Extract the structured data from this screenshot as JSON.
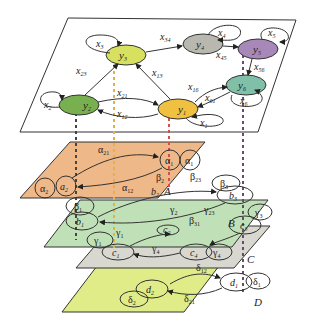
{
  "diagram": {
    "top_layer": {
      "nodes": [
        {
          "id": "y1",
          "label": "y",
          "sub": "1",
          "color": "#f0c040",
          "self_loop": "x1"
        },
        {
          "id": "y2",
          "label": "y",
          "sub": "2",
          "color": "#78b050",
          "self_loop": "x2"
        },
        {
          "id": "y3",
          "label": "y",
          "sub": "3",
          "color": "#d8e060",
          "self_loop": "x3"
        },
        {
          "id": "y4",
          "label": "y",
          "sub": "4",
          "color": "#b8b8b0",
          "self_loop": "x4"
        },
        {
          "id": "y5",
          "label": "y",
          "sub": "5",
          "color": "#a888b8",
          "self_loop": "x5"
        },
        {
          "id": "y6",
          "label": "y",
          "sub": "6",
          "color": "#80c0a8",
          "self_loop": "x6"
        }
      ],
      "edges": [
        {
          "from": "y3",
          "to": "y4",
          "label": "x34"
        },
        {
          "from": "y4",
          "to": "y5",
          "label": "x45"
        },
        {
          "from": "y5",
          "to": "y6",
          "label": "x56"
        },
        {
          "from": "y2",
          "to": "y3",
          "label": "x23"
        },
        {
          "from": "y1",
          "to": "y3",
          "label": "x13"
        },
        {
          "from": "y2",
          "to": "y1",
          "label": "x21"
        },
        {
          "from": "y1",
          "to": "y2",
          "label": "x12"
        },
        {
          "from": "y1",
          "to": "y6",
          "label": "x16"
        },
        {
          "from": "y6",
          "to": "y1",
          "label": "x61"
        }
      ]
    },
    "layer_A": {
      "name": "A",
      "color": "#eeb888",
      "nodes": [
        "a1",
        "a2"
      ],
      "labels": {
        "a21": "α21",
        "a12": "α12",
        "a1": "α1",
        "a2": "α2",
        "b2": "β2",
        "b23": "β23",
        "b12": "β12"
      }
    },
    "layer_B": {
      "name": "B",
      "color": "#c0e0b8",
      "nodes": [
        "b1",
        "b2",
        "b3"
      ],
      "labels": {
        "b1": "β1",
        "b3": "β3",
        "g2": "γ2",
        "g23": "γ23",
        "b31": "β31"
      }
    },
    "layer_C": {
      "name": "C",
      "color": "#d8d8d0",
      "nodes": [
        "c1",
        "c2",
        "c3",
        "c4"
      ],
      "labels": {
        "g1": "γ1",
        "g3": "γ3",
        "g4a": "γ4",
        "g4b": "γ4",
        "d12": "δ12"
      }
    },
    "layer_D": {
      "name": "D",
      "color": "#e0ec88",
      "nodes": [
        "d1",
        "d2"
      ],
      "labels": {
        "d1": "δ1",
        "d2": "δ2",
        "d12": "δ12",
        "d21": "δ21"
      }
    },
    "text": {
      "x1": "x",
      "x2": "x",
      "x3": "x",
      "x4": "x",
      "x5": "x",
      "x6": "x",
      "s1": "1",
      "s2": "2",
      "s3": "3",
      "s4": "4",
      "s5": "5",
      "s6": "6",
      "x34": "x",
      "s34": "34",
      "x45": "x",
      "s45": "45",
      "x56": "x",
      "s56": "56",
      "x23": "x",
      "s23": "23",
      "x13": "x",
      "s13": "13",
      "x21": "x",
      "s21": "21",
      "x12": "x",
      "s12": "12",
      "x16": "x",
      "s16": "16",
      "x61": "x",
      "s61": "61",
      "y": "y",
      "alpha": "α",
      "beta": "β",
      "gamma": "γ",
      "delta": "δ",
      "a": "a",
      "b": "b",
      "c": "c",
      "d": "d",
      "A": "A",
      "B": "B",
      "C": "C",
      "D": "D"
    }
  }
}
